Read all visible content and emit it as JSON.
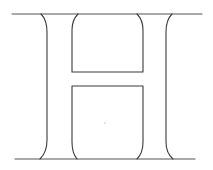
{
  "figure": {
    "glyph": "H",
    "colors": {
      "background": "#ffffff",
      "line": "#3a3a3a",
      "guide_line": "#555555",
      "center_mark": "#c8c8c8"
    }
  }
}
